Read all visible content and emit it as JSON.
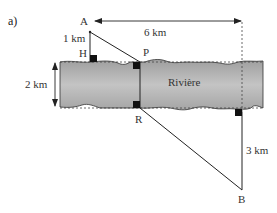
{
  "figure": {
    "part_label": "a)",
    "points": {
      "A": "A",
      "H": "H",
      "P": "P",
      "R": "R",
      "B": "B"
    },
    "measures": {
      "horizontal": "6 km",
      "AH": "1 km",
      "river_width": "2 km",
      "B_offset": "3 km"
    },
    "river_label": "Rivière",
    "colors": {
      "river_fill": "#b8b8b8",
      "line": "#222222",
      "background": "#ffffff"
    }
  }
}
